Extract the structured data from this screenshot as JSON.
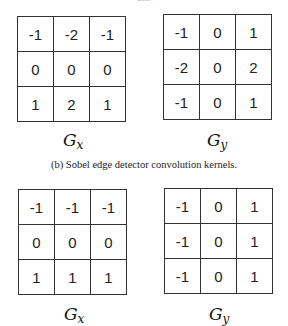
{
  "top_caption_fragment": "ues.",
  "figures": [
    {
      "kernels": [
        {
          "name": "Gx",
          "label_main": "G",
          "label_sub": "x",
          "rows": [
            [
              "-1",
              "-2",
              "-1"
            ],
            [
              "0",
              "0",
              "0"
            ],
            [
              "1",
              "2",
              "1"
            ]
          ]
        },
        {
          "name": "Gy",
          "label_main": "G",
          "label_sub": "y",
          "rows": [
            [
              "-1",
              "0",
              "1"
            ],
            [
              "-2",
              "0",
              "2"
            ],
            [
              "-1",
              "0",
              "1"
            ]
          ]
        }
      ],
      "caption": "(b)  Sobel edge detector convolution kernels."
    },
    {
      "kernels": [
        {
          "name": "Gx",
          "label_main": "G",
          "label_sub": "x",
          "rows": [
            [
              "-1",
              "-1",
              "-1"
            ],
            [
              "0",
              "0",
              "0"
            ],
            [
              "1",
              "1",
              "1"
            ]
          ]
        },
        {
          "name": "Gy",
          "label_main": "G",
          "label_sub": "y",
          "rows": [
            [
              "-1",
              "0",
              "1"
            ],
            [
              "-1",
              "0",
              "1"
            ],
            [
              "-1",
              "0",
              "1"
            ]
          ]
        }
      ]
    }
  ]
}
